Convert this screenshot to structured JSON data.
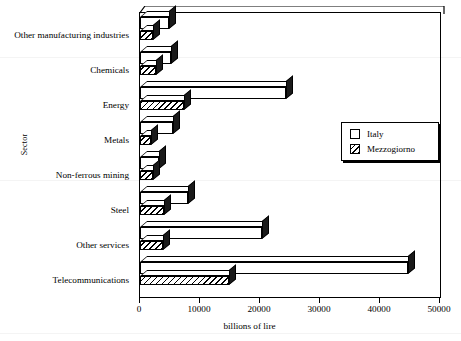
{
  "chart_data": {
    "type": "bar",
    "orientation": "horizontal",
    "title": "",
    "xlabel": "billions of lire",
    "ylabel": "Sector",
    "xlim": [
      0,
      50000
    ],
    "xticks": [
      0,
      10000,
      20000,
      30000,
      40000,
      50000
    ],
    "xticklabels": [
      "0",
      "10000",
      "20000",
      "30000",
      "40000",
      "50000"
    ],
    "grid": false,
    "legend_position": "middle-right",
    "categories": [
      "Other manufacturing industries",
      "Chemicals",
      "Energy",
      "Metals",
      "Non-ferrous mining",
      "Steel",
      "Other services",
      "Telecommunications"
    ],
    "series": [
      {
        "name": "Italy",
        "style": "white",
        "values": [
          4800,
          5200,
          24300,
          5500,
          3200,
          8000,
          20400,
          44700
        ]
      },
      {
        "name": "Mezzogiorno",
        "style": "hatched",
        "values": [
          2200,
          2600,
          7300,
          1800,
          2200,
          4000,
          3900,
          14800
        ]
      }
    ]
  },
  "axes": {
    "y_title": "Sector",
    "x_title": "billions of lire"
  },
  "legend": {
    "entries": [
      {
        "label": "Italy",
        "swatch": "white-square-icon"
      },
      {
        "label": "Mezzogiorno",
        "swatch": "hatched-square-icon"
      }
    ]
  }
}
